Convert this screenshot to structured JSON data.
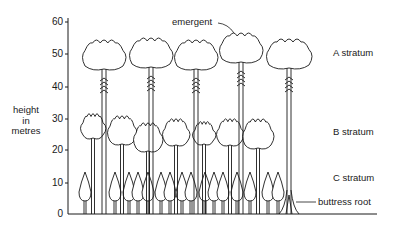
{
  "diagram": {
    "y_axis": {
      "label_lines": [
        "height",
        "in",
        "metres"
      ],
      "ticks": [
        {
          "value": "60",
          "y": 22
        },
        {
          "value": "50",
          "y": 54
        },
        {
          "value": "40",
          "y": 87
        },
        {
          "value": "30",
          "y": 119
        },
        {
          "value": "20",
          "y": 150
        },
        {
          "value": "10",
          "y": 183
        },
        {
          "value": "0",
          "y": 214
        }
      ]
    },
    "labels": {
      "emergent": "emergent",
      "a_stratum": "A stratum",
      "b_stratum": "B stratum",
      "c_stratum": "C stratum",
      "buttress_root": "buttress root"
    },
    "strata": [
      {
        "name": "A stratum",
        "height_range_m": [
          40,
          55
        ]
      },
      {
        "name": "B stratum",
        "height_range_m": [
          18,
          30
        ]
      },
      {
        "name": "C stratum",
        "height_range_m": [
          0,
          12
        ]
      }
    ],
    "a_trees": [
      {
        "cx": 104,
        "top": 40,
        "w": 44
      },
      {
        "cx": 151,
        "top": 38,
        "w": 44
      },
      {
        "cx": 196,
        "top": 40,
        "w": 44
      },
      {
        "cx": 241,
        "top": 33,
        "w": 44,
        "emergent": true
      },
      {
        "cx": 289,
        "top": 39,
        "w": 46,
        "buttress": true
      }
    ],
    "b_trees": [
      {
        "cx": 93,
        "top": 114,
        "w": 26
      },
      {
        "cx": 122,
        "top": 116,
        "w": 30
      },
      {
        "cx": 148,
        "top": 123,
        "w": 30
      },
      {
        "cx": 176,
        "top": 119,
        "w": 28
      },
      {
        "cx": 204,
        "top": 122,
        "w": 24
      },
      {
        "cx": 230,
        "top": 119,
        "w": 28
      },
      {
        "cx": 258,
        "top": 119,
        "w": 32
      }
    ],
    "c_trees": [
      85,
      115,
      129,
      138,
      148,
      161,
      170,
      182,
      191,
      205,
      214,
      223,
      237,
      250,
      268,
      278
    ]
  }
}
